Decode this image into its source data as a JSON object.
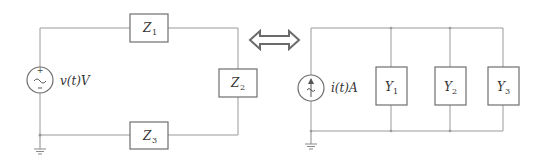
{
  "diagram": {
    "left_circuit": {
      "source": {
        "type": "voltage-source-ac",
        "label": "v(t)V",
        "polarity": [
          "+",
          "-"
        ]
      },
      "impedances": [
        {
          "id": "Z1",
          "base": "Z",
          "sub": "1",
          "position": "top"
        },
        {
          "id": "Z2",
          "base": "Z",
          "sub": "2",
          "position": "right"
        },
        {
          "id": "Z3",
          "base": "Z",
          "sub": "3",
          "position": "bottom"
        }
      ],
      "ground": true
    },
    "equivalence_arrow": {
      "type": "double-arrow",
      "meaning": "equivalent"
    },
    "right_circuit": {
      "source": {
        "type": "current-source-ac",
        "label": "i(t)A"
      },
      "admittances": [
        {
          "id": "Y1",
          "base": "Y",
          "sub": "1"
        },
        {
          "id": "Y2",
          "base": "Y",
          "sub": "2"
        },
        {
          "id": "Y3",
          "base": "Y",
          "sub": "3"
        }
      ],
      "ground": true
    }
  }
}
